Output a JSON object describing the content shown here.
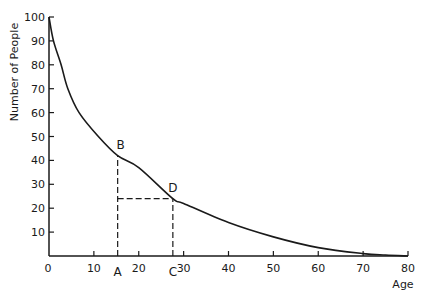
{
  "chart_data": {
    "type": "line",
    "title": "",
    "xlabel": "Age",
    "ylabel": "Number of People",
    "xlim": [
      0,
      80
    ],
    "ylim": [
      0,
      100
    ],
    "grid": false,
    "legend": null,
    "x_ticks": [
      0,
      10,
      20,
      30,
      40,
      50,
      60,
      70,
      80
    ],
    "y_ticks": [
      10,
      20,
      30,
      40,
      50,
      60,
      70,
      80,
      90,
      100
    ],
    "series": [
      {
        "name": "survival curve",
        "x": [
          0,
          1,
          2.7,
          4.2,
          6.7,
          11,
          15.3,
          20,
          27.6,
          30,
          40,
          50,
          60,
          70,
          75,
          80
        ],
        "values": [
          100,
          90,
          80,
          70,
          60,
          50,
          42,
          37,
          24,
          22,
          14,
          8,
          3.5,
          1,
          0.4,
          0
        ]
      }
    ],
    "annotations": [
      {
        "label": "A",
        "x": 15.3,
        "y": 0,
        "position": "below-axis"
      },
      {
        "label": "B",
        "x": 15.3,
        "y": 42,
        "position": "above-left"
      },
      {
        "label": "C",
        "x": 27.6,
        "y": 0,
        "position": "below-axis"
      },
      {
        "label": "D",
        "x": 27.6,
        "y": 24,
        "position": "above-right"
      }
    ],
    "dashed_lines": [
      {
        "from": [
          15.3,
          0
        ],
        "to": [
          15.3,
          42
        ]
      },
      {
        "from": [
          15.3,
          24
        ],
        "to": [
          27.6,
          24
        ]
      },
      {
        "from": [
          27.6,
          0
        ],
        "to": [
          27.6,
          24
        ]
      }
    ]
  },
  "colors": {
    "ink": "#1a1a1a",
    "background": "#ffffff"
  }
}
